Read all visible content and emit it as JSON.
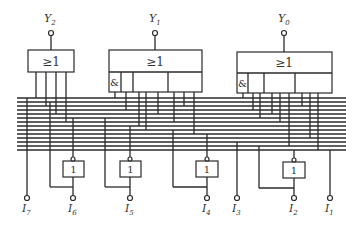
{
  "diagram": {
    "type": "logic-circuit",
    "outputs": [
      {
        "label": "Y",
        "sub": "2"
      },
      {
        "label": "Y",
        "sub": "1"
      },
      {
        "label": "Y",
        "sub": "0"
      }
    ],
    "inputs": [
      {
        "label": "I",
        "sub": "7"
      },
      {
        "label": "I",
        "sub": "6"
      },
      {
        "label": "I",
        "sub": "5"
      },
      {
        "label": "I",
        "sub": "4"
      },
      {
        "label": "I",
        "sub": "3"
      },
      {
        "label": "I",
        "sub": "2"
      },
      {
        "label": "I",
        "sub": "1"
      }
    ],
    "gates": {
      "or_symbol": "≥1",
      "and_symbol": "&",
      "not_symbol": "1"
    },
    "bus_line_count": 14
  }
}
